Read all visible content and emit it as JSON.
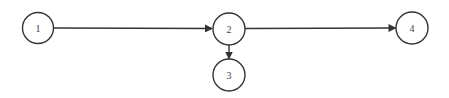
{
  "diagram": {
    "type": "directed-graph",
    "nodes": [
      {
        "id": "1",
        "label": "1",
        "cx": 38,
        "cy": 28,
        "r": 15.5
      },
      {
        "id": "2",
        "label": "2",
        "cx": 229,
        "cy": 29,
        "r": 16
      },
      {
        "id": "3",
        "label": "3",
        "cx": 229,
        "cy": 75,
        "r": 16
      },
      {
        "id": "4",
        "label": "4",
        "cx": 412,
        "cy": 28,
        "r": 16
      }
    ],
    "edges": [
      {
        "from": "1",
        "to": "2"
      },
      {
        "from": "2",
        "to": "3"
      },
      {
        "from": "2",
        "to": "4"
      }
    ],
    "colors": {
      "stroke": "#333333",
      "label": "#444444",
      "background": "#ffffff"
    }
  }
}
